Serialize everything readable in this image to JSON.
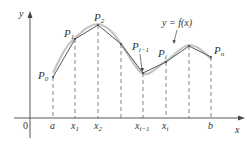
{
  "diagram": {
    "axes": {
      "x_label": "x",
      "y_label": "y",
      "origin_label": "0"
    },
    "curve_label": "y = f(x)",
    "x_ticks": [
      {
        "label": "a",
        "x": 53
      },
      {
        "label": "x1",
        "x": 75
      },
      {
        "label": "x2",
        "x": 98
      },
      {
        "label": "",
        "x": 121
      },
      {
        "label": "xi−1",
        "x": 143
      },
      {
        "label": "xi",
        "x": 166
      },
      {
        "label": "",
        "x": 189
      },
      {
        "label": "b",
        "x": 211
      }
    ],
    "points": [
      {
        "label": "P0",
        "x": 53,
        "y": 77
      },
      {
        "label": "P1",
        "x": 75,
        "y": 39
      },
      {
        "label": "P2",
        "x": 98,
        "y": 25
      },
      {
        "label": "",
        "x": 121,
        "y": 44
      },
      {
        "label": "Pi−1",
        "x": 143,
        "y": 73
      },
      {
        "label": "Pi",
        "x": 166,
        "y": 62
      },
      {
        "label": "",
        "x": 189,
        "y": 46
      },
      {
        "label": "Pn",
        "x": 211,
        "y": 57
      }
    ],
    "colors": {
      "polygon": "#555555",
      "curve": "#bbbbbb",
      "axis": "#444444",
      "dashes": "#666666"
    }
  }
}
